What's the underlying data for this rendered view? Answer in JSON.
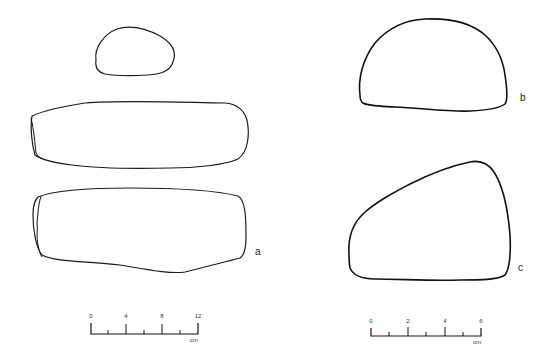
{
  "figure": {
    "labels": {
      "a": "a",
      "b": "b",
      "c": "c"
    },
    "scale_left": {
      "ticks": [
        "0",
        "4",
        "8",
        "12"
      ],
      "unit": "cm"
    },
    "scale_right": {
      "ticks": [
        "0",
        "2",
        "4",
        "6"
      ],
      "unit": "cm"
    },
    "stroke_color": "#1a1a1a",
    "background": "#ffffff"
  }
}
